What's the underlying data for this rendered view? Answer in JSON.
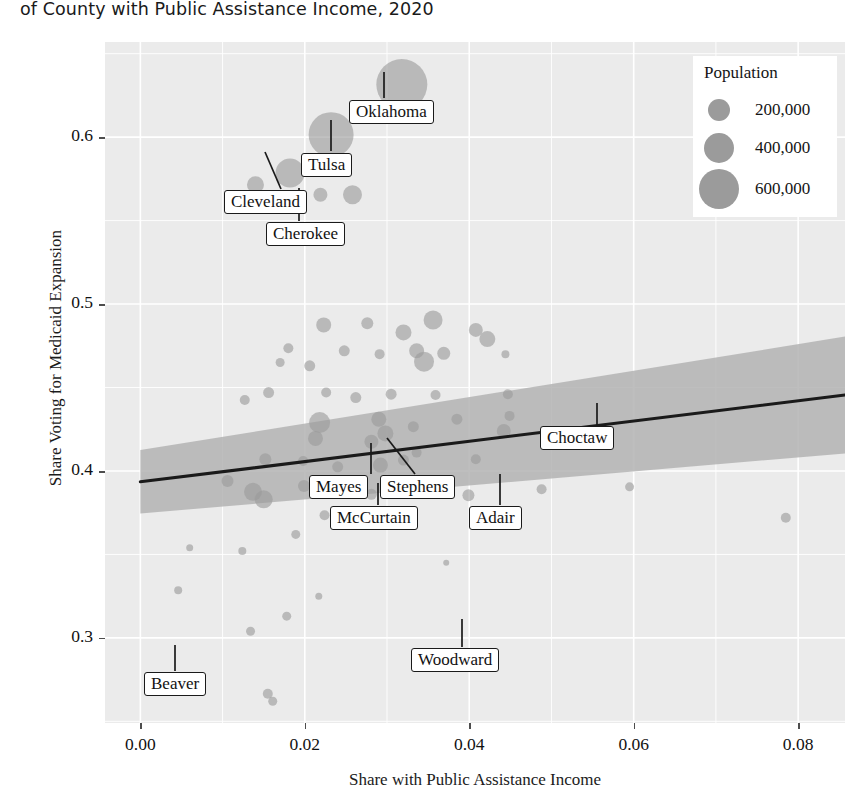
{
  "title": "of County with Public Assistance Income, 2020",
  "axes": {
    "xlabel": "Share with Public Assistance Income",
    "ylabel": "Share Voting for Medicaid Expansion",
    "xticks": [
      "0.00",
      "0.02",
      "0.04",
      "0.06",
      "0.08"
    ],
    "yticks": [
      "0.3",
      "0.4",
      "0.5",
      "0.6"
    ]
  },
  "legend": {
    "title": "Population",
    "items": [
      {
        "label": "200,000",
        "size": 200000,
        "radius": 11
      },
      {
        "label": "400,000",
        "size": 400000,
        "radius": 15
      },
      {
        "label": "600,000",
        "size": 600000,
        "radius": 20
      }
    ]
  },
  "chart_data": {
    "type": "scatter",
    "title": "of County with Public Assistance Income, 2020",
    "xlabel": "Share with Public Assistance Income",
    "ylabel": "Share Voting for Medicaid Expansion",
    "xlim": [
      -0.0043,
      0.0857
    ],
    "ylim": [
      0.249,
      0.657
    ],
    "xticks": [
      0.0,
      0.02,
      0.04,
      0.06,
      0.08
    ],
    "yticks": [
      0.3,
      0.4,
      0.5,
      0.6
    ],
    "grid": true,
    "legend_position": "top-right",
    "size_encoding": "Population",
    "point_color": "#9b9b9b",
    "band_color": "#b3b3b3",
    "line_color": "#1a1a1a",
    "trend": {
      "type": "linear-fit",
      "x": [
        0.0,
        0.0857
      ],
      "y": [
        0.3935,
        0.4455
      ],
      "band_lower": [
        0.3745,
        0.4105
      ],
      "band_upper": [
        0.4125,
        0.4805
      ]
    },
    "labeled_points": [
      {
        "name": "Oklahoma",
        "x": 0.0318,
        "y": 0.6315,
        "pop": 790000,
        "r": 25.5
      },
      {
        "name": "Tulsa",
        "x": 0.0232,
        "y": 0.6015,
        "pop": 660000,
        "r": 22.5
      },
      {
        "name": "Cleveland",
        "x": 0.0182,
        "y": 0.5785,
        "pop": 295000,
        "r": 14.5
      },
      {
        "name": "Cherokee",
        "x": 0.0219,
        "y": 0.5655,
        "pop": 48000,
        "r": 7.0
      },
      {
        "name": "Mayes",
        "x": 0.0281,
        "y": 0.4175,
        "pop": 40000,
        "r": 7.0
      },
      {
        "name": "Stephens",
        "x": 0.0298,
        "y": 0.4225,
        "pop": 43000,
        "r": 8.0
      },
      {
        "name": "McCurtain",
        "x": 0.0292,
        "y": 0.4035,
        "pop": 31000,
        "r": 7.5
      },
      {
        "name": "Adair",
        "x": 0.0399,
        "y": 0.3855,
        "pop": 22000,
        "r": 6.0
      },
      {
        "name": "Choctaw",
        "x": 0.0533,
        "y": 0.4215,
        "pop": 14000,
        "r": 4.0
      },
      {
        "name": "Beaver",
        "x": 0.0051,
        "y": 0.2685,
        "pop": 5300,
        "r": 5.0
      },
      {
        "name": "Woodward",
        "x": 0.0388,
        "y": 0.2835,
        "pop": 20000,
        "r": 5.0
      }
    ],
    "points": [
      {
        "x": 0.0318,
        "y": 0.6315,
        "r": 25.5
      },
      {
        "x": 0.0232,
        "y": 0.6015,
        "r": 22.5
      },
      {
        "x": 0.0182,
        "y": 0.5785,
        "r": 14.5
      },
      {
        "x": 0.014,
        "y": 0.5715,
        "r": 8.5
      },
      {
        "x": 0.0219,
        "y": 0.5655,
        "r": 7.0
      },
      {
        "x": 0.0258,
        "y": 0.5655,
        "r": 9.5
      },
      {
        "x": 0.0223,
        "y": 0.4875,
        "r": 7.5
      },
      {
        "x": 0.0276,
        "y": 0.4885,
        "r": 6.0
      },
      {
        "x": 0.032,
        "y": 0.483,
        "r": 8.0
      },
      {
        "x": 0.0356,
        "y": 0.4905,
        "r": 9.5
      },
      {
        "x": 0.0408,
        "y": 0.4845,
        "r": 7.0
      },
      {
        "x": 0.0422,
        "y": 0.479,
        "r": 8.0
      },
      {
        "x": 0.018,
        "y": 0.4735,
        "r": 5.0
      },
      {
        "x": 0.017,
        "y": 0.465,
        "r": 4.5
      },
      {
        "x": 0.0206,
        "y": 0.463,
        "r": 5.5
      },
      {
        "x": 0.0248,
        "y": 0.472,
        "r": 5.5
      },
      {
        "x": 0.0291,
        "y": 0.47,
        "r": 5.0
      },
      {
        "x": 0.0336,
        "y": 0.472,
        "r": 7.5
      },
      {
        "x": 0.0345,
        "y": 0.4655,
        "r": 10.0
      },
      {
        "x": 0.0369,
        "y": 0.4705,
        "r": 6.5
      },
      {
        "x": 0.0444,
        "y": 0.47,
        "r": 4.0
      },
      {
        "x": 0.0156,
        "y": 0.447,
        "r": 5.5
      },
      {
        "x": 0.0226,
        "y": 0.447,
        "r": 5.0
      },
      {
        "x": 0.0262,
        "y": 0.444,
        "r": 5.5
      },
      {
        "x": 0.0305,
        "y": 0.446,
        "r": 5.5
      },
      {
        "x": 0.0359,
        "y": 0.4455,
        "r": 5.0
      },
      {
        "x": 0.0447,
        "y": 0.446,
        "r": 5.0
      },
      {
        "x": 0.0127,
        "y": 0.4425,
        "r": 5.0
      },
      {
        "x": 0.0218,
        "y": 0.429,
        "r": 10.5
      },
      {
        "x": 0.0213,
        "y": 0.4195,
        "r": 7.5
      },
      {
        "x": 0.029,
        "y": 0.431,
        "r": 7.5
      },
      {
        "x": 0.0332,
        "y": 0.4265,
        "r": 5.5
      },
      {
        "x": 0.0385,
        "y": 0.431,
        "r": 5.5
      },
      {
        "x": 0.0442,
        "y": 0.424,
        "r": 7.0
      },
      {
        "x": 0.0449,
        "y": 0.433,
        "r": 5.0
      },
      {
        "x": 0.0533,
        "y": 0.4215,
        "r": 4.0
      },
      {
        "x": 0.0152,
        "y": 0.407,
        "r": 6.0
      },
      {
        "x": 0.0198,
        "y": 0.406,
        "r": 5.0
      },
      {
        "x": 0.024,
        "y": 0.4025,
        "r": 5.5
      },
      {
        "x": 0.0281,
        "y": 0.4175,
        "r": 7.0
      },
      {
        "x": 0.0298,
        "y": 0.4225,
        "r": 8.0
      },
      {
        "x": 0.0292,
        "y": 0.4035,
        "r": 7.5
      },
      {
        "x": 0.032,
        "y": 0.4065,
        "r": 5.5
      },
      {
        "x": 0.0336,
        "y": 0.411,
        "r": 5.0
      },
      {
        "x": 0.0408,
        "y": 0.407,
        "r": 5.0
      },
      {
        "x": 0.0106,
        "y": 0.394,
        "r": 6.0
      },
      {
        "x": 0.0137,
        "y": 0.3875,
        "r": 9.0
      },
      {
        "x": 0.015,
        "y": 0.383,
        "r": 9.0
      },
      {
        "x": 0.0199,
        "y": 0.391,
        "r": 6.0
      },
      {
        "x": 0.0249,
        "y": 0.388,
        "r": 5.5
      },
      {
        "x": 0.0263,
        "y": 0.3945,
        "r": 5.0
      },
      {
        "x": 0.0281,
        "y": 0.386,
        "r": 5.5
      },
      {
        "x": 0.0306,
        "y": 0.3915,
        "r": 5.0
      },
      {
        "x": 0.0356,
        "y": 0.39,
        "r": 4.5
      },
      {
        "x": 0.0399,
        "y": 0.3855,
        "r": 6.0
      },
      {
        "x": 0.0488,
        "y": 0.389,
        "r": 5.0
      },
      {
        "x": 0.0595,
        "y": 0.3905,
        "r": 4.5
      },
      {
        "x": 0.0785,
        "y": 0.372,
        "r": 5.0
      },
      {
        "x": 0.0224,
        "y": 0.3735,
        "r": 5.0
      },
      {
        "x": 0.0247,
        "y": 0.3695,
        "r": 4.5
      },
      {
        "x": 0.0271,
        "y": 0.376,
        "r": 4.0
      },
      {
        "x": 0.0189,
        "y": 0.362,
        "r": 4.5
      },
      {
        "x": 0.006,
        "y": 0.354,
        "r": 3.5
      },
      {
        "x": 0.0124,
        "y": 0.352,
        "r": 4.0
      },
      {
        "x": 0.0372,
        "y": 0.345,
        "r": 3.0
      },
      {
        "x": 0.0046,
        "y": 0.3285,
        "r": 4.0
      },
      {
        "x": 0.0217,
        "y": 0.325,
        "r": 3.5
      },
      {
        "x": 0.0178,
        "y": 0.313,
        "r": 4.5
      },
      {
        "x": 0.0134,
        "y": 0.304,
        "r": 4.5
      },
      {
        "x": 0.0051,
        "y": 0.2685,
        "r": 5.0
      },
      {
        "x": 0.0388,
        "y": 0.2835,
        "r": 5.0
      },
      {
        "x": 0.0155,
        "y": 0.2665,
        "r": 5.0
      },
      {
        "x": 0.0161,
        "y": 0.262,
        "r": 4.5
      }
    ]
  },
  "annotations": [
    {
      "name": "Oklahoma",
      "box_x": 349,
      "box_y": 100,
      "lead_x1": 384,
      "lead_y1": 98,
      "lead_x2": 384,
      "lead_y2": 72
    },
    {
      "name": "Tulsa",
      "box_x": 301,
      "box_y": 153,
      "lead_x1": 331,
      "lead_y1": 151,
      "lead_x2": 331,
      "lead_y2": 120
    },
    {
      "name": "Cleveland",
      "box_x": 224,
      "box_y": 190,
      "lead_x1": 281,
      "lead_y1": 189,
      "lead_x2": 265,
      "lead_y2": 152
    },
    {
      "name": "Cherokee",
      "box_x": 266,
      "box_y": 222,
      "lead_x1": 299,
      "lead_y1": 221,
      "lead_x2": 299,
      "lead_y2": 188
    },
    {
      "name": "Mayes",
      "box_x": 309,
      "box_y": 475,
      "lead_x1": 371,
      "lead_y1": 474,
      "lead_x2": 371,
      "lead_y2": 443
    },
    {
      "name": "Stephens",
      "box_x": 380,
      "box_y": 475,
      "lead_x1": 415,
      "lead_y1": 474,
      "lead_x2": 387,
      "lead_y2": 438
    },
    {
      "name": "McCurtain",
      "box_x": 330,
      "box_y": 506,
      "lead_x1": 378,
      "lead_y1": 505,
      "lead_x2": 378,
      "lead_y2": 483
    },
    {
      "name": "Adair",
      "box_x": 469,
      "box_y": 506,
      "lead_x1": 500,
      "lead_y1": 505,
      "lead_x2": 500,
      "lead_y2": 474
    },
    {
      "name": "Choctaw",
      "box_x": 540,
      "box_y": 426,
      "lead_x1": 597,
      "lead_y1": 425,
      "lead_x2": 597,
      "lead_y2": 403
    },
    {
      "name": "Beaver",
      "box_x": 144,
      "box_y": 672,
      "lead_x1": 175,
      "lead_y1": 671,
      "lead_x2": 175,
      "lead_y2": 645
    },
    {
      "name": "Woodward",
      "box_x": 411,
      "box_y": 648,
      "lead_x1": 462,
      "lead_y1": 647,
      "lead_x2": 462,
      "lead_y2": 619
    }
  ]
}
